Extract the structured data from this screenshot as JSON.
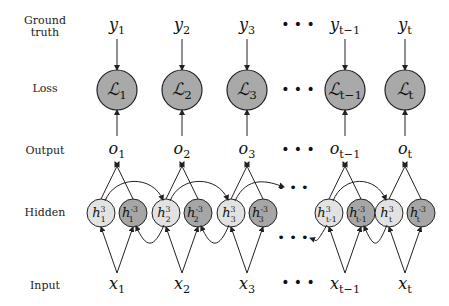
{
  "rows": {
    "ground_truth": "Ground truth",
    "ground_truth_l1": "Ground",
    "ground_truth_l2": "truth",
    "loss": "Loss",
    "output": "Output",
    "hidden": "Hidden",
    "input": "Input"
  },
  "columns": [
    {
      "y": "y",
      "y_sub": "1",
      "L": "ℒ",
      "L_sub": "1",
      "o": "o",
      "o_sub": "1",
      "x": "x",
      "x_sub": "1",
      "hf": "h",
      "hf_sup": "3",
      "hf_sub": "1",
      "hb": "h",
      "hb_sup": "-3",
      "hb_sub": "1"
    },
    {
      "y": "y",
      "y_sub": "2",
      "L": "ℒ",
      "L_sub": "2",
      "o": "o",
      "o_sub": "2",
      "x": "x",
      "x_sub": "2",
      "hf": "h",
      "hf_sup": "3",
      "hf_sub": "2",
      "hb": "h",
      "hb_sup": "-3",
      "hb_sub": "2"
    },
    {
      "y": "y",
      "y_sub": "3",
      "L": "ℒ",
      "L_sub": "3",
      "o": "o",
      "o_sub": "3",
      "x": "x",
      "x_sub": "3",
      "hf": "h",
      "hf_sup": "3",
      "hf_sub": "3",
      "hb": "h",
      "hb_sup": "-3",
      "hb_sub": "3"
    },
    {
      "y": "y",
      "y_sub": "t−1",
      "L": "ℒ",
      "L_sub": "t−1",
      "o": "o",
      "o_sub": "t−1",
      "x": "x",
      "x_sub": "t−1",
      "hf": "h",
      "hf_sup": "3",
      "hf_sub": "t-1",
      "hb": "h",
      "hb_sup": "-3",
      "hb_sub": "t-1"
    },
    {
      "y": "y",
      "y_sub": "t",
      "L": "ℒ",
      "L_sub": "t",
      "o": "o",
      "o_sub": "t",
      "x": "x",
      "x_sub": "t",
      "hf": "h",
      "hf_sup": "3",
      "hf_sub": "t",
      "hb": "h",
      "hb_sup": "-3",
      "hb_sub": "t"
    }
  ],
  "ellipsis": "• • •",
  "colors": {
    "loss_fill": "#a9a9a9",
    "forward_hidden_fill": "#e2e2e2",
    "backward_hidden_fill": "#a6a6a6",
    "stroke": "#222222"
  }
}
